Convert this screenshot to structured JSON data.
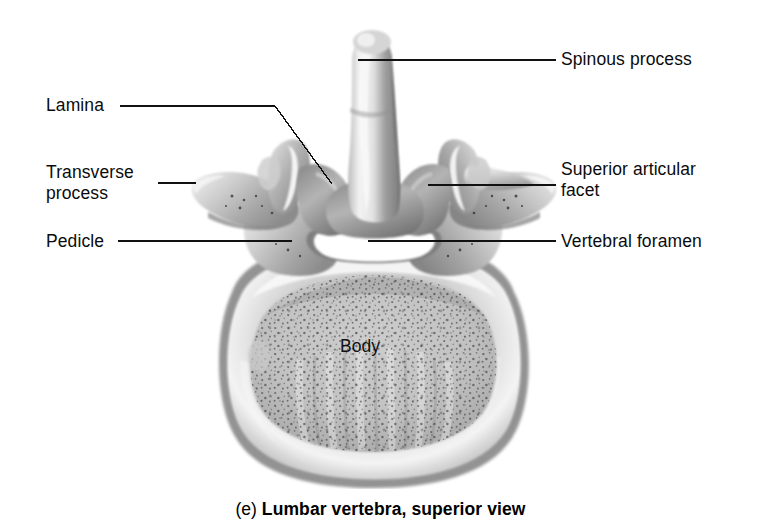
{
  "figure": {
    "caption_index": "(e)",
    "caption_title": "Lumbar vertebra, superior view",
    "view": "superior view",
    "subject": "Lumbar vertebra",
    "style": "grayscale anatomical photograph illustration on white background",
    "background_color": "#ffffff",
    "ink_color": "#000000"
  },
  "labels": {
    "lamina": "Lamina",
    "transverse_process_line1": "Transverse",
    "transverse_process_line2": "process",
    "pedicle": "Pedicle",
    "spinous_process": "Spinous process",
    "superior_articular_facet_line1": "Superior articular",
    "superior_articular_facet_line2": "facet",
    "vertebral_foramen": "Vertebral foramen",
    "body": "Body"
  },
  "leaders": [
    {
      "name": "lamina-leader",
      "points": "120,106 275,106 332,184"
    },
    {
      "name": "transverse-process-leader",
      "points": "158,183 196,183"
    },
    {
      "name": "pedicle-leader",
      "points": "118,241 292,241"
    },
    {
      "name": "spinous-process-leader",
      "points": "358,60 556,60"
    },
    {
      "name": "superior-facet-leader",
      "points": "428,185 556,185"
    },
    {
      "name": "vertebral-foramen-leader",
      "points": "368,241 556,241"
    }
  ]
}
